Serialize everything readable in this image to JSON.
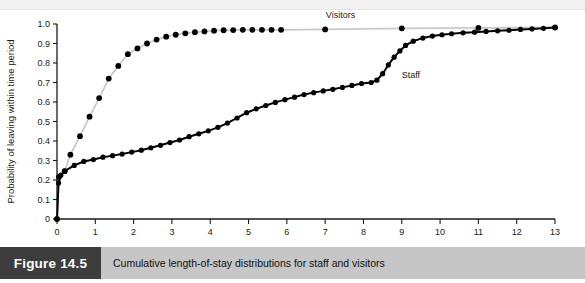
{
  "figure": {
    "tag": "Figure 14.5",
    "caption": "Cumulative length-of-stay distributions for staff and visitors"
  },
  "chart_data": {
    "type": "line",
    "title": "",
    "xlabel": "",
    "ylabel": "Probability of leaving within time period",
    "xlim": [
      0,
      13
    ],
    "ylim": [
      0,
      1.0
    ],
    "xticks": [
      "0",
      "1",
      "2",
      "3",
      "4",
      "5",
      "6",
      "7",
      "8",
      "9",
      "10",
      "11",
      "12",
      "13"
    ],
    "xtick_values": [
      0,
      1,
      2,
      3,
      4,
      5,
      6,
      7,
      8,
      9,
      10,
      11,
      12,
      13
    ],
    "yticks": [
      "0",
      "0.1",
      "0.2",
      "0.3",
      "0.4",
      "0.5",
      "0.6",
      "0.7",
      "0.8",
      "0.9",
      "1.0"
    ],
    "ytick_values": [
      0,
      0.1,
      0.2,
      0.3,
      0.4,
      0.5,
      0.6,
      0.7,
      0.8,
      0.9,
      1.0
    ],
    "grid": false,
    "legend_position": "inline-annotations",
    "annotations": [
      {
        "text": "Visitors",
        "x": 7.4,
        "y": 1.0
      },
      {
        "text": "Staff",
        "x": 9.0,
        "y": 0.745
      }
    ],
    "series": [
      {
        "name": "Visitors",
        "marker": "filled-circle",
        "line_color": "#c9c9c9",
        "marker_color": "#000000",
        "points": [
          [
            0.0,
            0.0
          ],
          [
            0.05,
            0.215
          ],
          [
            0.2,
            0.245
          ],
          [
            0.35,
            0.33
          ],
          [
            0.6,
            0.425
          ],
          [
            0.85,
            0.525
          ],
          [
            1.1,
            0.62
          ],
          [
            1.35,
            0.72
          ],
          [
            1.6,
            0.785
          ],
          [
            1.85,
            0.845
          ],
          [
            2.1,
            0.875
          ],
          [
            2.35,
            0.9
          ],
          [
            2.6,
            0.92
          ],
          [
            2.85,
            0.935
          ],
          [
            3.1,
            0.945
          ],
          [
            3.35,
            0.952
          ],
          [
            3.6,
            0.958
          ],
          [
            3.85,
            0.962
          ],
          [
            4.1,
            0.966
          ],
          [
            4.35,
            0.968
          ],
          [
            4.6,
            0.969
          ],
          [
            4.85,
            0.97
          ],
          [
            5.1,
            0.97
          ],
          [
            5.35,
            0.97
          ],
          [
            5.6,
            0.97
          ],
          [
            5.85,
            0.97
          ],
          [
            7.0,
            0.972
          ],
          [
            9.0,
            0.978
          ],
          [
            11.0,
            0.98
          ],
          [
            13.0,
            0.982
          ]
        ]
      },
      {
        "name": "Staff",
        "marker": "filled-circle",
        "line_color": "#000000",
        "marker_color": "#000000",
        "points": [
          [
            0.0,
            0.0
          ],
          [
            0.04,
            0.185
          ],
          [
            0.1,
            0.225
          ],
          [
            0.2,
            0.245
          ],
          [
            0.45,
            0.275
          ],
          [
            0.7,
            0.295
          ],
          [
            0.95,
            0.305
          ],
          [
            1.2,
            0.317
          ],
          [
            1.45,
            0.325
          ],
          [
            1.7,
            0.333
          ],
          [
            1.95,
            0.343
          ],
          [
            2.2,
            0.353
          ],
          [
            2.45,
            0.365
          ],
          [
            2.7,
            0.378
          ],
          [
            2.95,
            0.392
          ],
          [
            3.2,
            0.405
          ],
          [
            3.45,
            0.422
          ],
          [
            3.7,
            0.437
          ],
          [
            3.95,
            0.452
          ],
          [
            4.2,
            0.47
          ],
          [
            4.45,
            0.492
          ],
          [
            4.7,
            0.518
          ],
          [
            4.95,
            0.545
          ],
          [
            5.2,
            0.565
          ],
          [
            5.45,
            0.582
          ],
          [
            5.7,
            0.598
          ],
          [
            5.95,
            0.612
          ],
          [
            6.2,
            0.625
          ],
          [
            6.45,
            0.638
          ],
          [
            6.7,
            0.648
          ],
          [
            6.95,
            0.657
          ],
          [
            7.2,
            0.665
          ],
          [
            7.45,
            0.675
          ],
          [
            7.7,
            0.685
          ],
          [
            7.95,
            0.695
          ],
          [
            8.2,
            0.7
          ],
          [
            8.35,
            0.712
          ],
          [
            8.5,
            0.745
          ],
          [
            8.65,
            0.79
          ],
          [
            8.8,
            0.83
          ],
          [
            8.95,
            0.862
          ],
          [
            9.1,
            0.89
          ],
          [
            9.3,
            0.912
          ],
          [
            9.55,
            0.928
          ],
          [
            9.8,
            0.938
          ],
          [
            10.05,
            0.945
          ],
          [
            10.3,
            0.95
          ],
          [
            10.6,
            0.955
          ],
          [
            10.9,
            0.958
          ],
          [
            11.2,
            0.962
          ],
          [
            11.5,
            0.965
          ],
          [
            11.8,
            0.968
          ],
          [
            12.1,
            0.972
          ],
          [
            12.4,
            0.975
          ],
          [
            12.7,
            0.978
          ],
          [
            13.0,
            0.982
          ]
        ]
      }
    ]
  },
  "colors": {
    "axis": "#1a1a1a",
    "visitors_line": "#c9c9c9",
    "staff_line": "#000000",
    "caption_band": "#c6c6c6",
    "caption_tag": "#3d3d3d"
  }
}
